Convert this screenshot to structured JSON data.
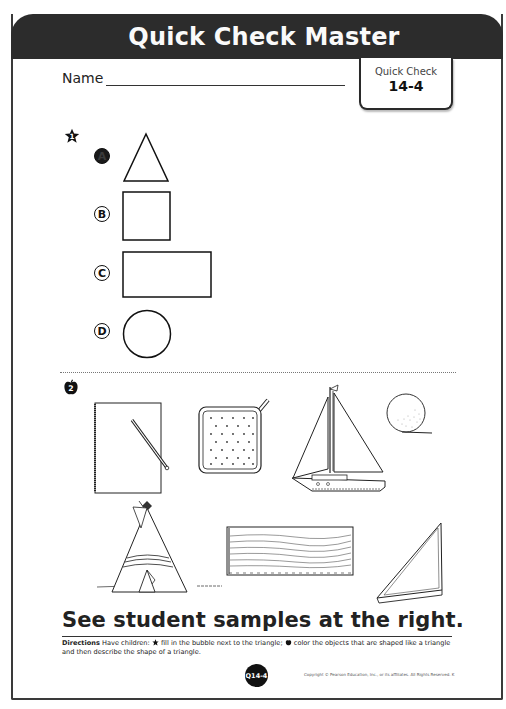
{
  "header": {
    "title": "Quick Check Master"
  },
  "name_field": {
    "label": "Name",
    "value": ""
  },
  "quick_check_tab": {
    "label": "Quick Check",
    "number": "14-4"
  },
  "item1": {
    "marker": "1",
    "marker_icon": "star-icon",
    "options": [
      {
        "letter": "A",
        "shape": "triangle",
        "selected": true
      },
      {
        "letter": "B",
        "shape": "square",
        "selected": false
      },
      {
        "letter": "C",
        "shape": "rectangle",
        "selected": false
      },
      {
        "letter": "D",
        "shape": "circle",
        "selected": false
      }
    ]
  },
  "item2": {
    "marker": "2",
    "marker_icon": "apple-icon",
    "objects": [
      {
        "name": "notebook-with-pencil",
        "shape": "rectangle"
      },
      {
        "name": "potholder",
        "shape": "square"
      },
      {
        "name": "sailboat",
        "shape": "triangle"
      },
      {
        "name": "ball",
        "shape": "circle"
      },
      {
        "name": "teepee",
        "shape": "triangle"
      },
      {
        "name": "wood-plank",
        "shape": "rectangle"
      },
      {
        "name": "triangle-ruler",
        "shape": "triangle"
      }
    ]
  },
  "footer": {
    "samples_text": "See student samples at the right.",
    "directions_label": "Directions",
    "directions_part1": " Have children: ",
    "directions_part2": " fill in the bubble next to the triangle; ",
    "directions_part3": " color the objects that are shaped like a triangle and then describe the shape of a triangle.",
    "page_badge": "Q14-4",
    "copyright": "Copyright © Pearson Education, Inc., or its affiliates. All Rights Reserved. K"
  }
}
